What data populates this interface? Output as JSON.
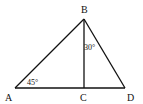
{
  "diagram": {
    "type": "geometry-triangle",
    "stroke_color": "#111111",
    "points": {
      "A": {
        "label": "A",
        "x": 15,
        "y": 88
      },
      "B": {
        "label": "B",
        "x": 84,
        "y": 19
      },
      "C": {
        "label": "C",
        "x": 84,
        "y": 88
      },
      "D": {
        "label": "D",
        "x": 125,
        "y": 88
      }
    },
    "segments": [
      "AB",
      "BD",
      "AD",
      "BC"
    ],
    "angles": [
      {
        "at": "A",
        "label": "45°"
      },
      {
        "at": "B",
        "between": "CB-BD",
        "label": "30°"
      }
    ]
  }
}
